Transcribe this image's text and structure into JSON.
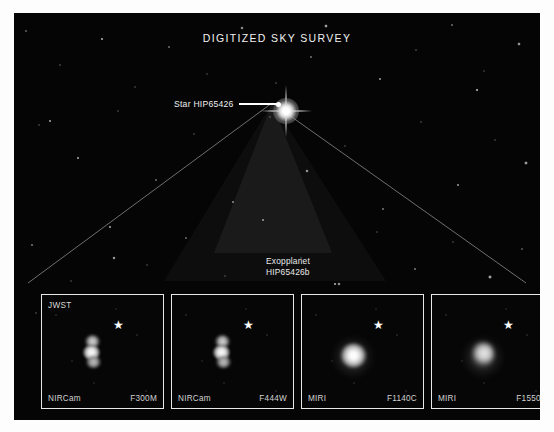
{
  "sky_image": {
    "title": "DIGITIZED SKY SURVEY",
    "star_callout": {
      "label": "Star HIP65426",
      "marker_icon": "leader-line-dot"
    },
    "planet_label_line1": "Exopplanet",
    "planet_label_line2": "HIP65426b",
    "host_star_icon": "bright-star-with-diffraction-spikes"
  },
  "colors": {
    "sky_background": "#050505",
    "panel_border": "#e8e8e8",
    "label_text": "#e9e9e9",
    "marker": "#ffffff"
  },
  "panels": [
    {
      "observatory": "JWST",
      "instrument": "NIRCam",
      "filter": "F300M",
      "star_marker_icon": "star-marker",
      "source_icon": "exoplanet-blob-triple"
    },
    {
      "observatory": "",
      "instrument": "NIRCam",
      "filter": "F444W",
      "star_marker_icon": "star-marker",
      "source_icon": "exoplanet-blob-triple"
    },
    {
      "observatory": "",
      "instrument": "MIRI",
      "filter": "F1140C",
      "star_marker_icon": "star-marker",
      "source_icon": "exoplanet-blob-round"
    },
    {
      "observatory": "",
      "instrument": "MIRI",
      "filter": "F1550C",
      "star_marker_icon": "star-marker",
      "source_icon": "exoplanet-blob-soft"
    }
  ]
}
